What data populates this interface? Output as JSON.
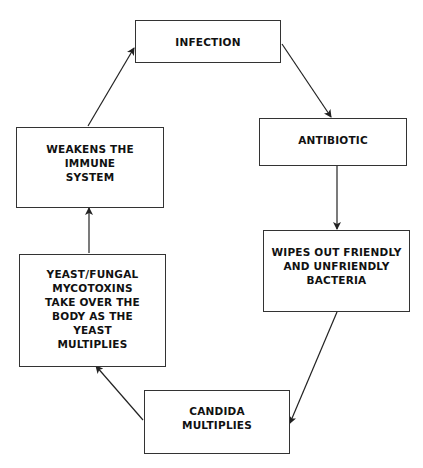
{
  "diagram": {
    "type": "cycle",
    "nodes": [
      {
        "id": "infection",
        "label": "INFECTION"
      },
      {
        "id": "antibiotic",
        "label": "ANTIBIOTIC"
      },
      {
        "id": "wipes_out",
        "label": "WIPES OUT FRIENDLY\nAND UNFRIENDLY\nBACTERIA"
      },
      {
        "id": "candida",
        "label": "CANDIDA\nMULTIPLIES"
      },
      {
        "id": "yeast",
        "label": "YEAST/FUNGAL\nMYCOTOXINS\nTAKE OVER THE\nBODY AS THE\nYEAST\nMULTIPLIES"
      },
      {
        "id": "weakens",
        "label": "WEAKENS THE\nIMMUNE\nSYSTEM"
      }
    ],
    "edges": [
      {
        "from": "infection",
        "to": "antibiotic"
      },
      {
        "from": "antibiotic",
        "to": "wipes_out"
      },
      {
        "from": "wipes_out",
        "to": "candida"
      },
      {
        "from": "candida",
        "to": "yeast"
      },
      {
        "from": "yeast",
        "to": "weakens"
      },
      {
        "from": "weakens",
        "to": "infection"
      }
    ]
  }
}
